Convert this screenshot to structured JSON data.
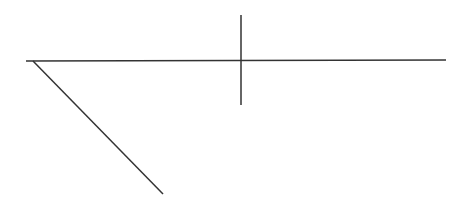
{
  "diagram": {
    "width": 469,
    "height": 198,
    "background": "#ffffff",
    "stroke_color": "#333333",
    "stroke_width": 1.5,
    "lines": [
      {
        "name": "horizontal-line",
        "x1": 26,
        "y1": 61,
        "x2": 446,
        "y2": 60
      },
      {
        "name": "vertical-line",
        "x1": 241,
        "y1": 15,
        "x2": 241,
        "y2": 105
      },
      {
        "name": "diagonal-line",
        "x1": 33,
        "y1": 61,
        "x2": 163,
        "y2": 194
      }
    ]
  }
}
